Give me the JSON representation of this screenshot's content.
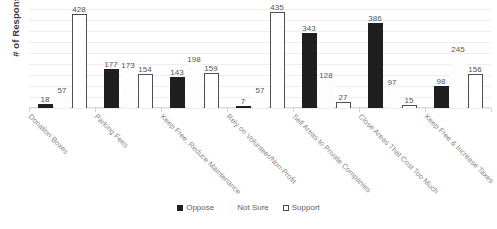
{
  "chart_data": {
    "type": "bar",
    "title": "",
    "xlabel": "",
    "ylabel": "# of Responses",
    "ylim": [
      0,
      450
    ],
    "ytick_values": [
      0,
      50,
      100,
      150,
      200,
      250,
      300,
      350,
      400,
      450
    ],
    "grid": true,
    "legend_position": "bottom",
    "categories": [
      "Donation Boxes",
      "Parking Fees",
      "Keep Free, Reduce Maintenance",
      "Rely on Volunteer/Non-Profit",
      "Sell Areas to Private Companies",
      "Close Areas That Cost Too Much",
      "Keep Free & Increase Taxes"
    ],
    "series": [
      {
        "name": "Oppose",
        "color": "#1f1f1f",
        "values": [
          18,
          177,
          143,
          7,
          343,
          386,
          98
        ]
      },
      {
        "name": "Not Sure",
        "color": "#fdfdfd",
        "values": [
          57,
          173,
          198,
          57,
          128,
          97,
          245
        ]
      },
      {
        "name": "Support",
        "color": "#ffffff",
        "values": [
          428,
          154,
          159,
          435,
          27,
          15,
          156
        ]
      }
    ]
  },
  "legend": {
    "items": [
      {
        "label": "Oppose",
        "swatch": "filled-square-icon"
      },
      {
        "label": "Not Sure",
        "swatch": "light-square-icon"
      },
      {
        "label": "Support",
        "swatch": "outline-square-icon"
      }
    ]
  }
}
